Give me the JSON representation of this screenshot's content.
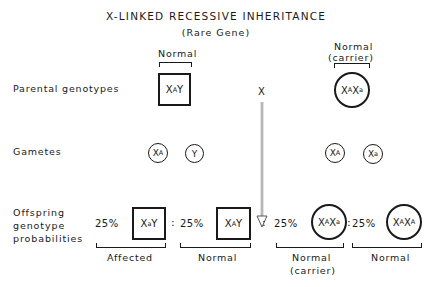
{
  "title": "X-LINKED RECESSIVE INHERITANCE",
  "subtitle": "(Rare Gene)",
  "row_labels": {
    "parental": "Parental genotypes",
    "gametes": "Gametes",
    "offspring_line1": "Offspring",
    "offspring_line2": "genotype",
    "offspring_line3": "probabilities"
  },
  "parents": {
    "father": {
      "label": "Normal",
      "shape": "square",
      "genotype_base1": "X",
      "genotype_sup1": "A",
      "genotype_base2": "Y"
    },
    "cross_symbol": "X",
    "mother": {
      "label_line1": "Normal",
      "label_line2": "(carrier)",
      "shape": "circle",
      "genotype_base1": "X",
      "genotype_sup1": "A",
      "genotype_base2": "X",
      "genotype_sup2": "a"
    }
  },
  "gametes": {
    "father": [
      {
        "base": "X",
        "sup": "A"
      },
      {
        "base": "Y",
        "sup": ""
      }
    ],
    "mother": [
      {
        "base": "X",
        "sup": "A"
      },
      {
        "base": "X",
        "sup": "a"
      }
    ]
  },
  "offspring": [
    {
      "percent": "25%",
      "shape": "square",
      "base1": "X",
      "sup1": "a",
      "base2": "Y",
      "sup2": "",
      "phenotype_line1": "Affected",
      "phenotype_line2": ""
    },
    {
      "percent": "25%",
      "shape": "square",
      "base1": "X",
      "sup1": "A",
      "base2": "Y",
      "sup2": "",
      "phenotype_line1": "Normal",
      "phenotype_line2": ""
    },
    {
      "percent": "25%",
      "shape": "circle",
      "base1": "X",
      "sup1": "A",
      "base2": "X",
      "sup2": "a",
      "phenotype_line1": "Normal",
      "phenotype_line2": "(carrier)"
    },
    {
      "percent": "25%",
      "shape": "circle",
      "base1": "X",
      "sup1": "A",
      "base2": "X",
      "sup2": "A",
      "phenotype_line1": "Normal",
      "phenotype_line2": ""
    }
  ],
  "separator": ":",
  "colors": {
    "ink": "#1a1a1a",
    "arrow": "#888888",
    "background": "#ffffff"
  }
}
